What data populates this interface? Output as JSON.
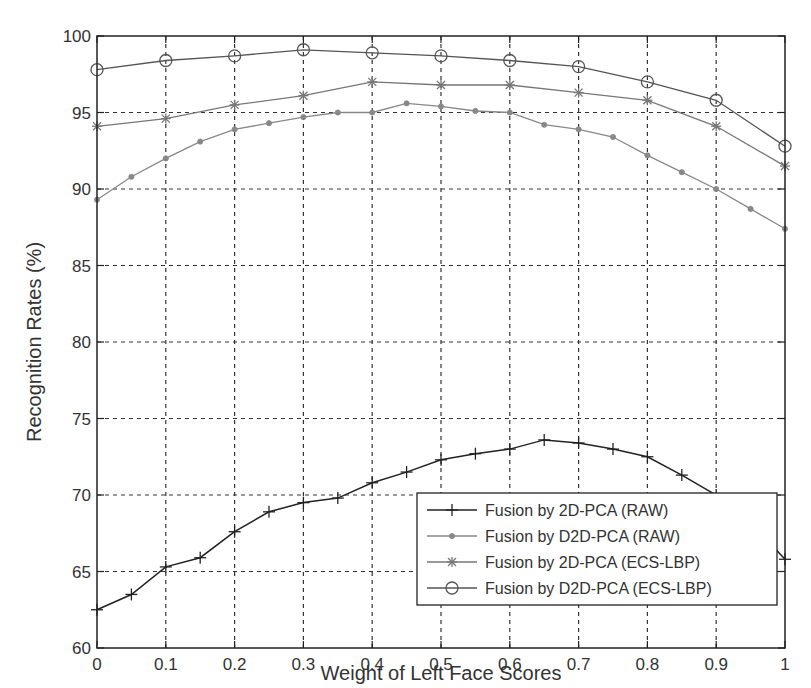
{
  "chart_data": {
    "type": "line",
    "title": "",
    "xlabel": "Weight of Left Face Scores",
    "ylabel": "Recognition Rates (%)",
    "xlim": [
      0,
      1
    ],
    "ylim": [
      60,
      100
    ],
    "x_ticks": [
      "0",
      "0.1",
      "0.2",
      "0.3",
      "0.4",
      "0.5",
      "0.6",
      "0.7",
      "0.8",
      "0.9",
      "1"
    ],
    "y_ticks": [
      "60",
      "65",
      "70",
      "75",
      "80",
      "85",
      "90",
      "95",
      "100"
    ],
    "grid": true,
    "legend_position": "lower right",
    "series": [
      {
        "name": "Fusion by 2D-PCA (RAW)",
        "marker": "plus",
        "color": "#222222",
        "x": [
          0,
          0.05,
          0.1,
          0.15,
          0.2,
          0.25,
          0.3,
          0.35,
          0.4,
          0.45,
          0.5,
          0.55,
          0.6,
          0.65,
          0.7,
          0.75,
          0.8,
          0.85,
          0.9,
          0.95,
          1
        ],
        "values": [
          62.5,
          63.5,
          65.3,
          65.9,
          67.6,
          68.9,
          69.5,
          69.8,
          70.8,
          71.5,
          72.3,
          72.7,
          73.0,
          73.6,
          73.4,
          73.0,
          72.5,
          71.3,
          70.0,
          68.2,
          65.8
        ]
      },
      {
        "name": "Fusion by D2D-PCA (RAW)",
        "marker": "dot",
        "color": "#888888",
        "x": [
          0,
          0.05,
          0.1,
          0.15,
          0.2,
          0.25,
          0.3,
          0.35,
          0.4,
          0.45,
          0.5,
          0.55,
          0.6,
          0.65,
          0.7,
          0.75,
          0.8,
          0.85,
          0.9,
          0.95,
          1
        ],
        "values": [
          89.3,
          90.8,
          92.0,
          93.1,
          93.9,
          94.3,
          94.7,
          95.0,
          95.0,
          95.6,
          95.4,
          95.1,
          95.0,
          94.2,
          93.9,
          93.4,
          92.2,
          91.1,
          90.0,
          88.7,
          87.4
        ]
      },
      {
        "name": "Fusion by 2D-PCA (ECS-LBP)",
        "marker": "asterisk",
        "color": "#777777",
        "x": [
          0,
          0.1,
          0.2,
          0.3,
          0.4,
          0.5,
          0.6,
          0.7,
          0.8,
          0.9,
          1
        ],
        "values": [
          94.1,
          94.6,
          95.5,
          96.1,
          97.0,
          96.8,
          96.8,
          96.3,
          95.8,
          94.1,
          91.5
        ]
      },
      {
        "name": "Fusion by D2D-PCA (ECS-LBP)",
        "marker": "circle",
        "color": "#555555",
        "x": [
          0,
          0.1,
          0.2,
          0.3,
          0.4,
          0.5,
          0.6,
          0.7,
          0.8,
          0.9,
          1
        ],
        "values": [
          97.8,
          98.4,
          98.7,
          99.1,
          98.9,
          98.7,
          98.4,
          98.0,
          97.0,
          95.8,
          92.8
        ]
      }
    ]
  }
}
